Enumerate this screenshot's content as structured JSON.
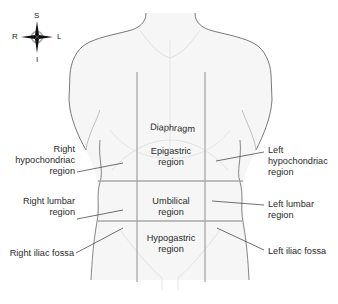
{
  "diagram": {
    "compass": {
      "top": "S",
      "bottom": "I",
      "left": "R",
      "right": "L"
    },
    "labels": {
      "diaphragm": "Diaphragm",
      "epigastric": [
        "Epigastric",
        "region"
      ],
      "umbilical": [
        "Umbilical",
        "region"
      ],
      "hypogastric": [
        "Hypogastric",
        "region"
      ],
      "right_hypochondriac": [
        "Right",
        "hypochondriac",
        "region"
      ],
      "left_hypochondriac": [
        "Left",
        "hypochondriac",
        "region"
      ],
      "right_lumbar": [
        "Right lumbar",
        "region"
      ],
      "left_lumbar": [
        "Left lumbar",
        "region"
      ],
      "right_iliac": "Right iliac fossa",
      "left_iliac": "Left iliac fossa"
    },
    "colors": {
      "body_fill": "#f5f5f5",
      "body_outline": "#6a6a6a",
      "grid_lines": "#a8a8a8",
      "leader_lines": "#333333",
      "text": "#2a2a2a"
    }
  }
}
